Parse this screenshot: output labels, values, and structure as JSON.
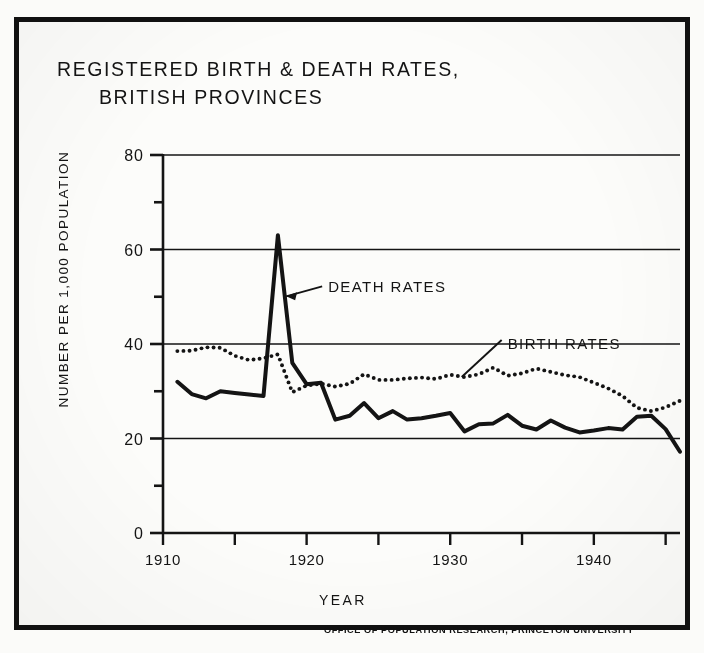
{
  "figure": {
    "title_line1": "REGISTERED BIRTH & DEATH RATES,",
    "title_line2": "BRITISH PROVINCES",
    "credit": "OFFICE OF POPULATION RESEARCH, PRINCETON UNIVERSITY",
    "ink_color": "#141414",
    "paper_color": "#fcfcfa",
    "border_color": "#111111"
  },
  "chart_data": {
    "type": "line",
    "title": "REGISTERED BIRTH & DEATH RATES, BRITISH PROVINCES",
    "subtitle": "",
    "xlabel": "YEAR",
    "ylabel": "NUMBER PER 1,000 POPULATION",
    "xlim": [
      1910,
      1946
    ],
    "ylim": [
      0,
      80
    ],
    "xticks": [
      1910,
      1915,
      1920,
      1925,
      1930,
      1935,
      1940,
      1945
    ],
    "xticklabels": [
      "1910",
      "",
      "1920",
      "",
      "1930",
      "",
      "1940",
      ""
    ],
    "yticks": [
      0,
      10,
      20,
      30,
      40,
      50,
      60,
      70,
      80
    ],
    "yticklabels": [
      "0",
      "",
      "20",
      "",
      "40",
      "",
      "60",
      "",
      "80"
    ],
    "grid": "horizontal-major-only",
    "gridlines_at": [
      0,
      20,
      40,
      60,
      80
    ],
    "legend": "inline-annotations",
    "x": [
      1911,
      1912,
      1913,
      1914,
      1915,
      1916,
      1917,
      1918,
      1919,
      1920,
      1921,
      1922,
      1923,
      1924,
      1925,
      1926,
      1927,
      1928,
      1929,
      1930,
      1931,
      1932,
      1933,
      1934,
      1935,
      1936,
      1937,
      1938,
      1939,
      1940,
      1941,
      1942,
      1943,
      1944,
      1945,
      1946
    ],
    "series": [
      {
        "name": "DEATH RATES",
        "style": "solid",
        "linewidth": 4,
        "color": "#141414",
        "values": [
          32.0,
          29.4,
          28.5,
          30.0,
          29.6,
          29.3,
          29.0,
          63.0,
          36.0,
          31.5,
          31.8,
          24.0,
          24.8,
          27.5,
          24.3,
          25.8,
          24.0,
          24.3,
          24.8,
          25.4,
          21.5,
          23.0,
          23.2,
          25.0,
          22.7,
          21.9,
          23.8,
          22.3,
          21.3,
          21.7,
          22.2,
          21.9,
          24.6,
          24.8,
          22.0,
          17.2
        ]
      },
      {
        "name": "BIRTH RATES",
        "style": "dotted",
        "linewidth": 3.6,
        "color": "#141414",
        "values": [
          38.5,
          38.6,
          39.3,
          39.2,
          37.5,
          36.6,
          37.0,
          37.8,
          29.8,
          31.2,
          31.6,
          31.0,
          31.6,
          33.6,
          32.4,
          32.4,
          32.7,
          32.9,
          32.6,
          33.5,
          33.0,
          33.6,
          35.0,
          33.3,
          33.8,
          34.8,
          34.1,
          33.4,
          33.0,
          31.8,
          30.6,
          29.0,
          26.5,
          25.8,
          26.6,
          28.0
        ]
      }
    ],
    "annotations": [
      {
        "text": "DEATH RATES",
        "points_to_series": "DEATH RATES",
        "x": 1921.5,
        "y": 52
      },
      {
        "text": "BIRTH RATES",
        "points_to_series": "BIRTH RATES",
        "x": 1934.0,
        "y": 40
      }
    ]
  }
}
